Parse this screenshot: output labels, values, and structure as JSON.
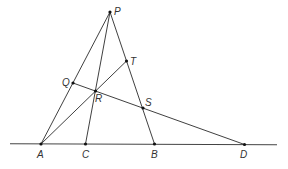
{
  "diagram": {
    "type": "geometry-construction",
    "points": {
      "P": {
        "label": "P",
        "x": 110,
        "y": 12
      },
      "T": {
        "label": "T",
        "x": 126.5,
        "y": 61
      },
      "Q": {
        "label": "Q",
        "x": 73,
        "y": 83
      },
      "R": {
        "label": "R",
        "x": 95.5,
        "y": 91
      },
      "S": {
        "label": "S",
        "x": 143,
        "y": 108
      },
      "A": {
        "label": "A",
        "x": 41,
        "y": 144
      },
      "C": {
        "label": "C",
        "x": 85.5,
        "y": 144
      },
      "B": {
        "label": "B",
        "x": 154.5,
        "y": 144
      },
      "D": {
        "label": "D",
        "x": 244.5,
        "y": 144.5
      }
    },
    "segments": [
      [
        "P",
        "A"
      ],
      [
        "P",
        "C"
      ],
      [
        "P",
        "B"
      ],
      [
        "A",
        "T"
      ],
      [
        "Q",
        "D"
      ]
    ],
    "baseline": {
      "x1": 10,
      "y1": 143.8,
      "x2": 277,
      "y2": 144.8
    }
  }
}
